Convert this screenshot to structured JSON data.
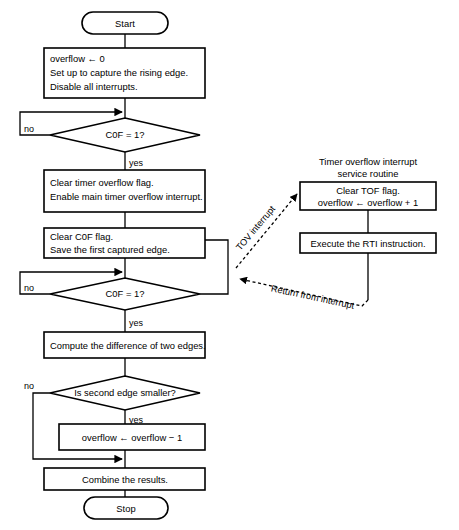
{
  "diagram": {
    "colors": {
      "stroke": "#000000",
      "fill": "#ffffff",
      "text": "#000000"
    },
    "terminators": {
      "start": "Start",
      "stop": "Stop"
    },
    "main_flow": {
      "init_box": {
        "line1": "overflow ← 0",
        "line2": "Set up to capture the rising edge.",
        "line3": "Disable all interrupts."
      },
      "decision_1": {
        "label": "C0F = 1?",
        "no_label": "no",
        "yes_label": "yes"
      },
      "clear_tof_box": {
        "line1": "Clear timer overflow flag.",
        "line2": "Enable main timer overflow interrupt."
      },
      "clear_c0f_box": {
        "line1": "Clear C0F flag.",
        "line2": "Save the first captured edge."
      },
      "decision_2": {
        "label": "C0F = 1?",
        "no_label": "no",
        "yes_label": "yes"
      },
      "compute_box": {
        "line1": "Compute the difference of two edges."
      },
      "decision_3": {
        "label": "Is second edge smaller?",
        "no_label": "no",
        "yes_label": "yes"
      },
      "adjust_box": {
        "line1": "overflow ← overflow − 1"
      },
      "combine_box": {
        "line1": "Combine the results."
      }
    },
    "isr": {
      "title_line1": "Timer overflow interrupt",
      "title_line2": "service routine",
      "clear_tof_box": {
        "line1": "Clear TOF flag.",
        "line2": "overflow ← overflow + 1"
      },
      "rti_box": {
        "line1": "Execute the RTI instruction."
      }
    },
    "edge_labels": {
      "tov_interrupt": "TOV interrupt",
      "return_from_interrupt": "Return from interrupt"
    }
  }
}
